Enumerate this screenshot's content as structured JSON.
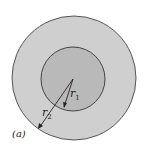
{
  "figure": {
    "label": "(a)",
    "outer_circle": {
      "cx": 74,
      "cy": 78,
      "r": 62,
      "fill": "#cfcfcf",
      "stroke": "#555555"
    },
    "inner_circle": {
      "cx": 73,
      "cy": 79,
      "r": 32,
      "fill": "#b8b8b8",
      "stroke": "#444444"
    },
    "radius_labels": {
      "r1": {
        "text": "r",
        "sub": "1"
      },
      "r2": {
        "text": "r",
        "sub": "2"
      }
    }
  }
}
